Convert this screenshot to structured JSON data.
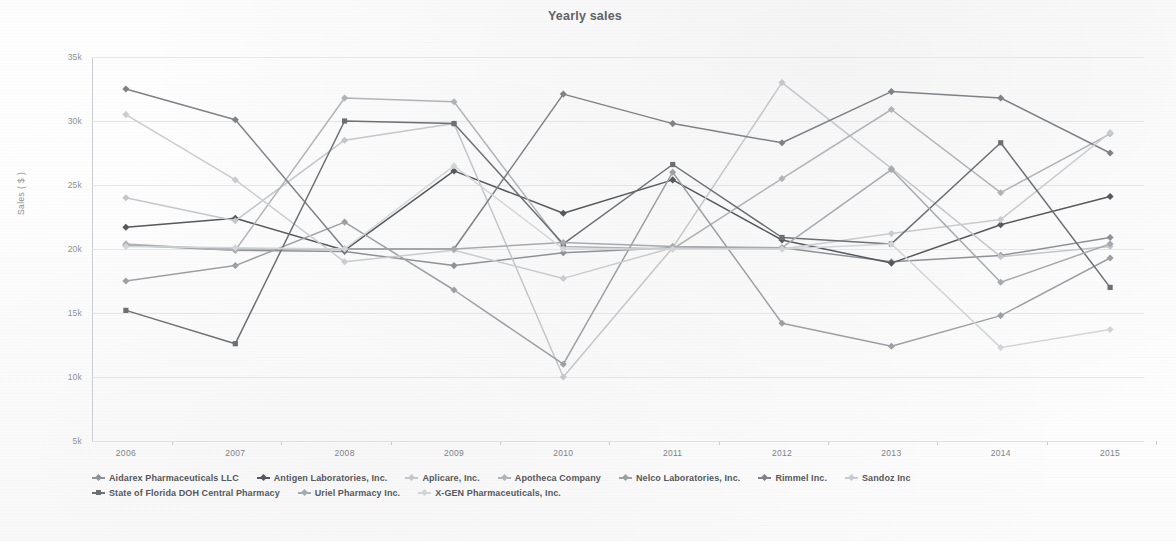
{
  "chart_data": {
    "type": "line",
    "title": "Yearly sales",
    "xlabel": "",
    "ylabel": "Sales ( $ )",
    "categories": [
      "2006",
      "2007",
      "2008",
      "2009",
      "2010",
      "2011",
      "2012",
      "2013",
      "2014",
      "2015"
    ],
    "x_tick_labels": [
      "2006",
      "2007",
      "2008",
      "2009",
      "2010",
      "2011",
      "2012",
      "2013",
      "2014",
      "2015"
    ],
    "y_tick_labels": [
      "35k",
      "30k",
      "25k",
      "20k",
      "15k",
      "10k",
      "5k"
    ],
    "y_tick_values": [
      35000,
      30000,
      25000,
      20000,
      15000,
      10000,
      5000
    ],
    "ylim": [
      5000,
      35000
    ],
    "grid": true,
    "legend_position": "bottom",
    "series": [
      {
        "name": "Aidarex Pharmaceuticals LLC",
        "color": "#8e9296",
        "marker": "diamond",
        "values": [
          20300,
          19900,
          19800,
          18700,
          19700,
          20100,
          20100,
          19000,
          19500,
          20900
        ]
      },
      {
        "name": "Antigen Laboratories, Inc.",
        "color": "#55585c",
        "marker": "diamond",
        "values": [
          21700,
          22400,
          19900,
          26100,
          22800,
          25400,
          20700,
          18900,
          21900,
          24100
        ]
      },
      {
        "name": "Aplicare, Inc.",
        "color": "#c3c6ca",
        "marker": "diamond",
        "values": [
          24000,
          22200,
          28500,
          29800,
          10000,
          20100,
          33000,
          26300,
          19400,
          20200
        ]
      },
      {
        "name": "Apotheca Company",
        "color": "#b0b4b8",
        "marker": "diamond",
        "values": [
          20400,
          19900,
          31800,
          31500,
          20200,
          20000,
          25500,
          30900,
          24400,
          29000
        ]
      },
      {
        "name": "Nelco Laboratories, Inc.",
        "color": "#9ca0a4",
        "marker": "diamond",
        "values": [
          17500,
          18700,
          22100,
          16800,
          11000,
          26000,
          14200,
          12400,
          14800,
          19300
        ]
      },
      {
        "name": "Rimmel Inc.",
        "color": "#7e8287",
        "marker": "diamond",
        "values": [
          32500,
          30100,
          20000,
          20000,
          32100,
          29800,
          28300,
          32300,
          31800,
          27500
        ]
      },
      {
        "name": "Sandoz Inc",
        "color": "#c8cbcf",
        "marker": "diamond",
        "values": [
          30500,
          25400,
          19000,
          19900,
          17700,
          20100,
          20000,
          21200,
          22300,
          29100
        ]
      },
      {
        "name": "State of Florida DOH Central Pharmacy",
        "color": "#6c7075",
        "marker": "square",
        "values": [
          15200,
          12600,
          30000,
          29800,
          20400,
          26600,
          20900,
          20400,
          28300,
          17000
        ]
      },
      {
        "name": "Uriel Pharmacy Inc.",
        "color": "#a6aaae",
        "marker": "diamond",
        "values": [
          20300,
          20000,
          20000,
          20000,
          20500,
          20200,
          20100,
          26200,
          17400,
          20400
        ]
      },
      {
        "name": "X-GEN Pharmaceuticals, Inc.",
        "color": "#d2d5d8",
        "marker": "diamond",
        "values": [
          20200,
          20100,
          20000,
          26500,
          20000,
          20000,
          20000,
          20400,
          12300,
          13700
        ]
      },
      {
        "name": "Apotheca Company B",
        "color": "#94989c",
        "marker": "diamond",
        "values": [
          20350,
          20050,
          19950,
          20000,
          20100,
          20050,
          20050,
          20100,
          20050,
          20500
        ],
        "hidden": true
      }
    ]
  },
  "legend": {
    "rows": [
      [
        "Aidarex Pharmaceuticals LLC",
        "Antigen Laboratories, Inc.",
        "Aplicare, Inc.",
        "Apotheca Company",
        "Nelco Laboratories, Inc.",
        "Rimmel Inc.",
        "Sandoz Inc"
      ],
      [
        "State of Florida DOH Central Pharmacy",
        "Uriel Pharmacy Inc.",
        "X-GEN Pharmaceuticals, Inc."
      ]
    ]
  }
}
